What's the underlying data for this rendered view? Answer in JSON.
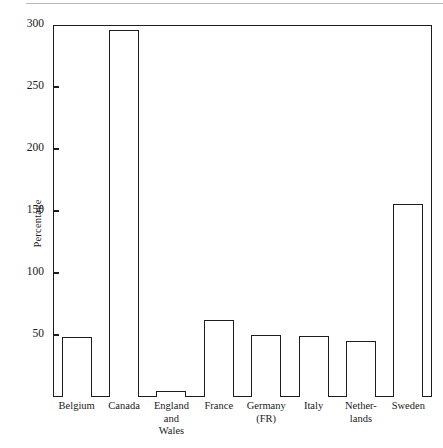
{
  "figure": {
    "has_top_scan_rule": true
  },
  "chart_data": {
    "type": "bar",
    "title": "",
    "subtitle": "",
    "xlabel": "",
    "ylabel": "Percentage",
    "ylim": [
      0,
      300
    ],
    "yticks": [
      50,
      100,
      150,
      200,
      250,
      300
    ],
    "ytick_labels": [
      "50",
      "100",
      "150",
      "200",
      "250",
      "300"
    ],
    "grid": false,
    "legend": false,
    "categories": [
      "Belgium",
      "Canada",
      "England\nand\nWales",
      "France",
      "Germany\n(FR)",
      "Italy",
      "Nether-\nlands",
      "Sweden"
    ],
    "values": [
      48,
      296,
      5,
      62,
      50,
      49,
      45,
      156
    ],
    "bar_style": {
      "fill": "#ffffff",
      "edge": "#1d1d1d",
      "edge_width": 1.6
    }
  },
  "axis_colors": {
    "frame": "#1d1d1d",
    "text": "#1a1a1a",
    "background": "#ffffff"
  }
}
